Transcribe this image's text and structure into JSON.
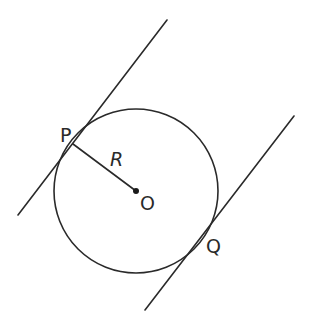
{
  "diagram": {
    "type": "geometry",
    "colors": {
      "stroke": "#2a2a2a",
      "background": "#ffffff"
    },
    "circle": {
      "center_label": "O",
      "cx": 136,
      "cy": 191,
      "r": 82
    },
    "radius": {
      "label": "R",
      "from": "P",
      "to": "O"
    },
    "points": [
      {
        "id": "P",
        "label": "P",
        "x": 73,
        "y": 144
      },
      {
        "id": "O",
        "label": "O",
        "x": 136,
        "y": 191
      },
      {
        "id": "Q",
        "label": "Q",
        "x": 205,
        "y": 235
      }
    ],
    "tangent_lines": [
      {
        "name": "tangent-at-P",
        "touches": "P",
        "x1": 167,
        "y1": 20,
        "x2": 18,
        "y2": 215
      },
      {
        "name": "tangent-at-Q",
        "touches": "Q",
        "x1": 294,
        "y1": 116,
        "x2": 145,
        "y2": 310
      }
    ],
    "labels": {
      "P": "P",
      "R": "R",
      "O": "O",
      "Q": "Q"
    }
  }
}
